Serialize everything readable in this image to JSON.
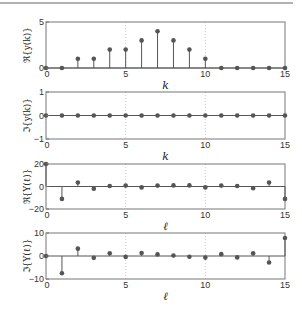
{
  "chart_data": [
    {
      "type": "stem",
      "ylabel": "ℜ{y(k)}",
      "xlabel": "k",
      "x": [
        0,
        1,
        2,
        3,
        4,
        5,
        6,
        7,
        8,
        9,
        10,
        11,
        12,
        13,
        14,
        15
      ],
      "values": [
        0,
        0,
        1,
        1,
        2,
        2,
        3,
        4,
        3,
        2,
        1,
        0,
        0,
        0,
        0,
        0
      ],
      "xlim": [
        0,
        15
      ],
      "ylim": [
        0,
        5
      ],
      "xticks": [
        0,
        5,
        10,
        15
      ],
      "yticks": [
        0,
        5
      ],
      "grid": "vertical dotted at x=5,10"
    },
    {
      "type": "stem",
      "ylabel": "ℑ{y(k)}",
      "xlabel": "k",
      "x": [
        0,
        1,
        2,
        3,
        4,
        5,
        6,
        7,
        8,
        9,
        10,
        11,
        12,
        13,
        14,
        15
      ],
      "values": [
        0,
        0,
        0,
        0,
        0,
        0,
        0,
        0,
        0,
        0,
        0,
        0,
        0,
        0,
        0,
        0
      ],
      "xlim": [
        0,
        15
      ],
      "ylim": [
        -1,
        1
      ],
      "xticks": [
        0,
        5,
        10,
        15
      ],
      "yticks": [
        -1,
        0,
        1
      ],
      "grid": "vertical dotted at x=5,10"
    },
    {
      "type": "stem",
      "ylabel": "ℜ{Y(ℓ)}",
      "xlabel": "ℓ",
      "x": [
        0,
        1,
        2,
        3,
        4,
        5,
        6,
        7,
        8,
        9,
        10,
        11,
        12,
        13,
        14,
        15
      ],
      "values": [
        20,
        -11,
        3.5,
        -2,
        0.5,
        0.8,
        -0.8,
        0.8,
        1,
        1,
        -0.8,
        0.8,
        0.5,
        -1.5,
        3.5,
        -11
      ],
      "xlim": [
        0,
        15
      ],
      "ylim": [
        -20,
        20
      ],
      "xticks": [
        0,
        5,
        10,
        15
      ],
      "yticks": [
        -20,
        0,
        20
      ],
      "grid": "vertical dotted at x=5,10"
    },
    {
      "type": "stem",
      "ylabel": "ℑ{Y(ℓ)}",
      "xlabel": "ℓ",
      "x": [
        0,
        1,
        2,
        3,
        4,
        5,
        6,
        7,
        8,
        9,
        10,
        11,
        12,
        13,
        14,
        15
      ],
      "values": [
        0,
        -7.5,
        3.2,
        -0.8,
        1.2,
        -0.4,
        1.3,
        0.7,
        0.2,
        -0.3,
        -0.7,
        0.8,
        -0.6,
        1.2,
        -2.8,
        7.8
      ],
      "xlim": [
        0,
        15
      ],
      "ylim": [
        -10,
        10
      ],
      "xticks": [
        0,
        5,
        10,
        15
      ],
      "yticks": [
        -10,
        0,
        10
      ],
      "grid": "vertical dotted at x=5,10"
    }
  ],
  "colors": {
    "stem": "#555555",
    "axes": "#777777",
    "grid": "#bbbbbb",
    "rule": "#999999"
  }
}
